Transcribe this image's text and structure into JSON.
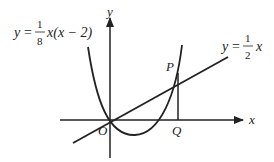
{
  "diagram": {
    "equations": {
      "parabola": {
        "lhs": "y",
        "eq": "=",
        "num": "1",
        "den": "8",
        "rhs": "x(x − 2)"
      },
      "line": {
        "lhs": "y",
        "eq": "=",
        "num": "1",
        "den": "2",
        "rhs": "x"
      }
    },
    "axes": {
      "x_label": "x",
      "y_label": "y"
    },
    "points": {
      "origin": "O",
      "p": "P",
      "q": "Q"
    },
    "colors": {
      "stroke": "#222222",
      "background": "#ffffff"
    }
  }
}
